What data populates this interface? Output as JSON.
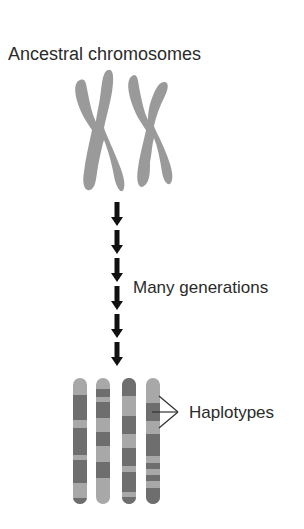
{
  "diagram": {
    "top_label": "Ancestral chromosomes",
    "middle_label": "Many generations",
    "bottom_label": "Haplotypes",
    "arrow_count": 6,
    "colors": {
      "text": "#2b2b2b",
      "ancestral_chromosome": "#9a9a9a",
      "band_light": "#a8a8a8",
      "band_dark": "#6e6e6e",
      "arrow": "#111111",
      "bracket_line": "#333333"
    },
    "ancestral_chromosomes": [
      {
        "name": "ancestral-chromosome-1"
      },
      {
        "name": "ancestral-chromosome-2"
      }
    ],
    "haplotype_chromosomes": [
      {
        "name": "haplotype-chromosome-1",
        "bands": [
          "light",
          "dark",
          "light",
          "dark",
          "light",
          "dark",
          "light",
          "dark"
        ]
      },
      {
        "name": "haplotype-chromosome-2",
        "bands": [
          "light",
          "dark",
          "light",
          "dark",
          "light",
          "dark",
          "light",
          "dark",
          "light"
        ]
      },
      {
        "name": "haplotype-chromosome-3",
        "bands": [
          "dark",
          "light",
          "dark",
          "light",
          "dark",
          "light",
          "dark",
          "light",
          "dark"
        ]
      },
      {
        "name": "haplotype-chromosome-4",
        "bands": [
          "light",
          "dark",
          "light",
          "dark",
          "light",
          "dark",
          "light",
          "dark"
        ]
      }
    ]
  }
}
